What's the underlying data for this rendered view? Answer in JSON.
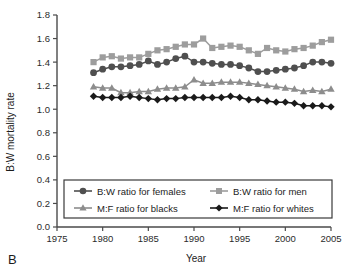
{
  "panel": {
    "label": "B"
  },
  "chart_data": {
    "type": "line",
    "title": "",
    "xlabel": "Year",
    "ylabel": "B:W mortality rate",
    "xlim": [
      1975,
      2005
    ],
    "ylim": [
      0.0,
      1.8
    ],
    "xticks": [
      1975,
      1980,
      1985,
      1990,
      1995,
      2000,
      2005
    ],
    "yticks": [
      "0.0",
      "0.2",
      "0.4",
      "0.6",
      "0.8",
      "1.0",
      "1.2",
      "1.4",
      "1.6",
      "1.8"
    ],
    "grid": false,
    "legend_position": "lower-center",
    "x": [
      1979,
      1980,
      1981,
      1982,
      1983,
      1984,
      1985,
      1986,
      1987,
      1988,
      1989,
      1990,
      1991,
      1992,
      1993,
      1994,
      1995,
      1996,
      1997,
      1998,
      1999,
      2000,
      2001,
      2002,
      2003,
      2004,
      2005
    ],
    "series": [
      {
        "name": "B:W ratio for men",
        "marker": "square",
        "color": "#9d9d9d",
        "values": [
          1.4,
          1.44,
          1.45,
          1.43,
          1.44,
          1.44,
          1.47,
          1.5,
          1.51,
          1.53,
          1.55,
          1.55,
          1.6,
          1.52,
          1.53,
          1.54,
          1.53,
          1.5,
          1.47,
          1.52,
          1.5,
          1.49,
          1.51,
          1.52,
          1.54,
          1.57,
          1.59
        ]
      },
      {
        "name": "B:W ratio for females",
        "marker": "circle",
        "color": "#4f4f4f",
        "values": [
          1.31,
          1.34,
          1.36,
          1.36,
          1.37,
          1.38,
          1.41,
          1.38,
          1.4,
          1.43,
          1.45,
          1.4,
          1.4,
          1.39,
          1.38,
          1.38,
          1.37,
          1.35,
          1.32,
          1.32,
          1.33,
          1.34,
          1.35,
          1.37,
          1.4,
          1.4,
          1.39
        ]
      },
      {
        "name": "M:F ratio for blacks",
        "marker": "triangle",
        "color": "#8d8d8d",
        "values": [
          1.19,
          1.18,
          1.18,
          1.14,
          1.14,
          1.15,
          1.15,
          1.17,
          1.18,
          1.18,
          1.19,
          1.25,
          1.22,
          1.22,
          1.23,
          1.23,
          1.23,
          1.22,
          1.21,
          1.2,
          1.19,
          1.18,
          1.17,
          1.15,
          1.16,
          1.15,
          1.17
        ]
      },
      {
        "name": "M:F ratio for whites",
        "marker": "diamond",
        "color": "#1a1a1a",
        "values": [
          1.11,
          1.1,
          1.1,
          1.1,
          1.11,
          1.1,
          1.09,
          1.08,
          1.09,
          1.09,
          1.1,
          1.1,
          1.1,
          1.1,
          1.1,
          1.11,
          1.1,
          1.08,
          1.08,
          1.07,
          1.06,
          1.06,
          1.05,
          1.03,
          1.03,
          1.03,
          1.02
        ]
      }
    ],
    "legend": [
      {
        "label": "B:W ratio for females",
        "marker": "circle",
        "color": "#4f4f4f"
      },
      {
        "label": "B:W ratio for men",
        "marker": "square",
        "color": "#9d9d9d"
      },
      {
        "label": "M:F ratio for blacks",
        "marker": "triangle",
        "color": "#8d8d8d"
      },
      {
        "label": "M:F ratio for whites",
        "marker": "diamond",
        "color": "#1a1a1a"
      }
    ]
  }
}
